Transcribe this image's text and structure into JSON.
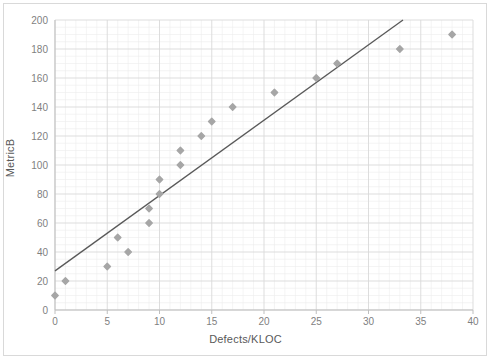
{
  "chart_data": {
    "type": "scatter",
    "title": "",
    "xlabel": "Defects/KLOC",
    "ylabel": "MetricB",
    "xlim": [
      0,
      40
    ],
    "ylim": [
      0,
      200
    ],
    "x_major_ticks": [
      0,
      5,
      10,
      15,
      20,
      25,
      30,
      35,
      40
    ],
    "y_major_ticks": [
      0,
      20,
      40,
      60,
      80,
      100,
      120,
      140,
      160,
      180,
      200
    ],
    "x_minor_step": 1,
    "y_minor_step": 5,
    "grid": true,
    "legend": false,
    "marker_color": "#a6a6a6",
    "trendline_color": "#595959",
    "gridline_color": "#d9d9d9",
    "minor_gridline_color": "#ededed",
    "axis_color": "#bfbfbf",
    "points": [
      {
        "x": 0,
        "y": 10
      },
      {
        "x": 1,
        "y": 20
      },
      {
        "x": 5,
        "y": 30
      },
      {
        "x": 6,
        "y": 50
      },
      {
        "x": 7,
        "y": 40
      },
      {
        "x": 9,
        "y": 60
      },
      {
        "x": 9,
        "y": 70
      },
      {
        "x": 10,
        "y": 80
      },
      {
        "x": 10,
        "y": 90
      },
      {
        "x": 12,
        "y": 100
      },
      {
        "x": 12,
        "y": 110
      },
      {
        "x": 14,
        "y": 120
      },
      {
        "x": 15,
        "y": 130
      },
      {
        "x": 17,
        "y": 140
      },
      {
        "x": 21,
        "y": 150
      },
      {
        "x": 25,
        "y": 160
      },
      {
        "x": 27,
        "y": 170
      },
      {
        "x": 33,
        "y": 180
      },
      {
        "x": 38,
        "y": 190
      }
    ],
    "trendline": {
      "x0": 0,
      "y0": 27,
      "x1": 33.3,
      "y1": 200
    }
  }
}
